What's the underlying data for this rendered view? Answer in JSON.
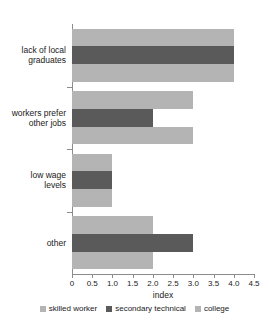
{
  "chart_data": {
    "type": "bar",
    "orientation": "horizontal",
    "title": "",
    "xlabel": "index",
    "ylabel": "",
    "xlim": [
      0,
      4.5
    ],
    "xticks": [
      "0",
      "0.5",
      "1.0",
      "1.5",
      "2.0",
      "2.5",
      "3.0",
      "3.5",
      "4.0",
      "4.5"
    ],
    "xtick_values": [
      0,
      0.5,
      1.0,
      1.5,
      2.0,
      2.5,
      3.0,
      3.5,
      4.0,
      4.5
    ],
    "grid": false,
    "legend_position": "bottom",
    "categories": [
      "lack of local graduates",
      "workers prefer other jobs",
      "low wage levels",
      "other"
    ],
    "category_lines": [
      [
        "lack of local",
        "graduates"
      ],
      [
        "workers prefer",
        "other jobs"
      ],
      [
        "low wage",
        "levels"
      ],
      [
        "other",
        ""
      ]
    ],
    "series": [
      {
        "name": "skilled worker",
        "color": "#b4b4b4",
        "values": [
          4.0,
          3.0,
          1.0,
          2.0
        ]
      },
      {
        "name": "secondary technical",
        "color": "#5a5a5a",
        "values": [
          4.0,
          2.0,
          1.0,
          3.0
        ]
      },
      {
        "name": "college",
        "color": "#b4b4b4",
        "values": [
          4.0,
          3.0,
          1.0,
          2.0
        ]
      }
    ]
  },
  "axis": {
    "line_color": "#8c8c8c"
  }
}
